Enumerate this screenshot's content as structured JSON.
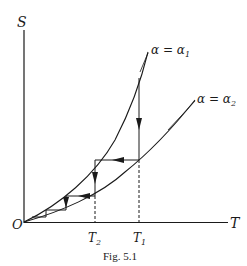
{
  "figure": {
    "caption": "Fig. 5.1",
    "axes": {
      "y_label": "S",
      "x_label": "T",
      "origin_label": "O"
    },
    "ticks": {
      "t2_label": "T",
      "t2_sub": "2",
      "t1_label": "T",
      "t1_sub": "1"
    },
    "curves": [
      {
        "id": "alpha1",
        "label": "α = α",
        "sub": "1",
        "description": "steeper entropy curve"
      },
      {
        "id": "alpha2",
        "label": "α = α",
        "sub": "2",
        "description": "shallower entropy curve"
      }
    ],
    "process": "staircase of alternating vertical (isothermal, downward) and horizontal (adiabatic, leftward) arrows between the two curves, starting at T1 and descending toward O",
    "colors": {
      "ink": "#1a1a1a",
      "background": "#ffffff"
    }
  }
}
